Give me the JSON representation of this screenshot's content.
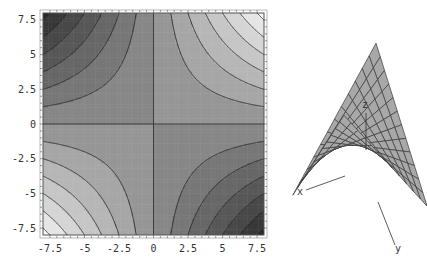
{
  "chart_data": [
    {
      "type": "contour",
      "function": "z = x*y",
      "title": "",
      "xlabel": "",
      "ylabel": "",
      "xlim": [
        -8,
        8
      ],
      "ylim": [
        -8,
        8
      ],
      "x_ticks": [
        "-7.5",
        "-5",
        "-2.5",
        "0",
        "2.5",
        "5",
        "7.5"
      ],
      "y_ticks": [
        "7.5",
        "5",
        "2.5",
        "0",
        "-2.5",
        "-5",
        "-7.5"
      ],
      "contour_levels": [
        -60,
        -50,
        -40,
        -30,
        -20,
        -10,
        0,
        10,
        20,
        30,
        40,
        50,
        60
      ],
      "shading": "grayscale, dark for negative (top-left, bottom-right), light for positive (top-right, bottom-left)",
      "grid": false,
      "legend": "none"
    },
    {
      "type": "surface3d",
      "function": "z = x*y (hyperbolic paraboloid / saddle)",
      "axis_labels": {
        "x": "x",
        "y": "y",
        "z": "z"
      },
      "mesh": true,
      "shading": "gray"
    }
  ],
  "surface": {
    "x_label": "x",
    "y_label": "y",
    "z_label": "z"
  }
}
